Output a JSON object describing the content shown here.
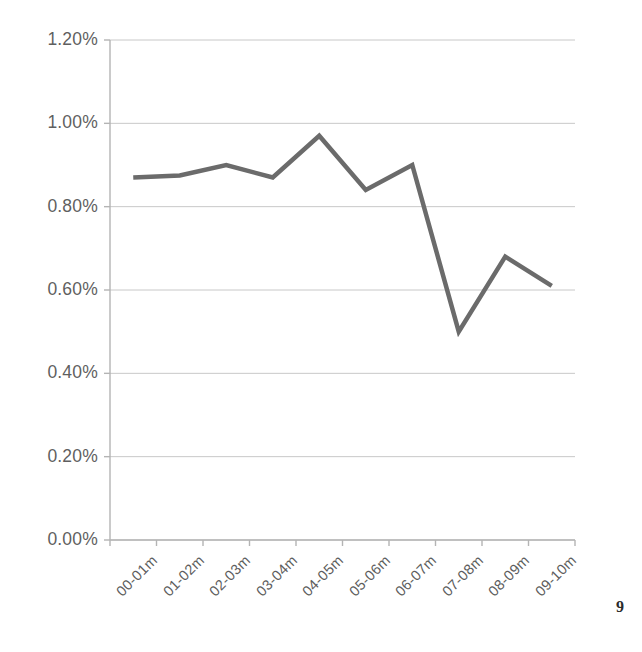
{
  "page": {
    "page_number": "9",
    "background_color": "#ffffff"
  },
  "chart_data": {
    "type": "line",
    "title": "",
    "subtitle": "",
    "xlabel": "",
    "ylabel": "",
    "categories": [
      "00-01m",
      "01-02m",
      "02-03m",
      "03-04m",
      "04-05m",
      "05-06m",
      "06-07m",
      "07-08m",
      "08-09m",
      "09-10m"
    ],
    "values": [
      0.87,
      0.875,
      0.9,
      0.87,
      0.97,
      0.84,
      0.9,
      0.5,
      0.68,
      0.61
    ],
    "value_unit": "%",
    "series": [
      {
        "name": "series-1",
        "values": [
          0.87,
          0.875,
          0.9,
          0.87,
          0.97,
          0.84,
          0.9,
          0.5,
          0.68,
          0.61
        ],
        "color": "#6b6b6b"
      }
    ],
    "ylim": [
      0.0,
      1.2
    ],
    "ytick_values": [
      0.0,
      0.2,
      0.4,
      0.6,
      0.8,
      1.0,
      1.2
    ],
    "ytick_labels": [
      "0.00%",
      "0.20%",
      "0.40%",
      "0.60%",
      "0.80%",
      "1.00%",
      "1.20%"
    ],
    "grid": true,
    "grid_axis": "y",
    "grid_color": "#c8c8c8",
    "axis_color": "#b4b4b4",
    "legend": false,
    "legend_position": "none",
    "markers": false,
    "line_width": 4.5,
    "xtick_rotation": -45,
    "annotations": []
  },
  "plot_geometry": {
    "left": 110,
    "right": 575,
    "top": 40,
    "bottom": 540
  }
}
